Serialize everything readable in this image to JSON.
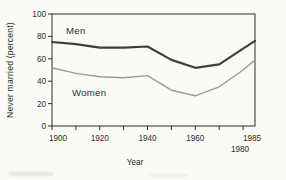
{
  "figure": {
    "background": "#fbfaf7",
    "axis_color": "#2c2c2c",
    "text_color": "#2e2e2e"
  },
  "chart_data": {
    "type": "line",
    "title": "",
    "xlabel": "Year",
    "ylabel": "Never married (percent)",
    "x": [
      1900,
      1910,
      1920,
      1930,
      1940,
      1950,
      1960,
      1970,
      1980,
      1985
    ],
    "series": [
      {
        "name": "Men",
        "color": "#3f3f3f",
        "stroke_width": 2.2,
        "values": [
          75,
          73,
          70,
          70,
          71,
          59,
          52,
          55,
          69,
          76
        ]
      },
      {
        "name": "Women",
        "color": "#9b9b9b",
        "stroke_width": 1.4,
        "values": [
          52,
          47,
          44,
          43,
          45,
          32,
          27,
          35,
          50,
          59
        ]
      }
    ],
    "xlim": [
      1900,
      1985
    ],
    "ylim": [
      0,
      100
    ],
    "x_ticks": [
      1900,
      1910,
      1920,
      1930,
      1940,
      1950,
      1960,
      1970,
      1980
    ],
    "x_tick_labels": [
      {
        "text": "1900",
        "year": 1900,
        "dx": 6,
        "row": 0
      },
      {
        "text": "1920",
        "year": 1920,
        "dx": 0,
        "row": 0
      },
      {
        "text": "1940",
        "year": 1940,
        "dx": 0,
        "row": 0
      },
      {
        "text": "1960",
        "year": 1960,
        "dx": 0,
        "row": 0
      },
      {
        "text": "1985",
        "year": 1985,
        "dx": -3,
        "row": 0
      },
      {
        "text": "1980",
        "year": 1980,
        "dx": -3,
        "row": 1
      }
    ],
    "y_ticks": [
      0,
      20,
      40,
      60,
      80,
      100
    ],
    "grid": false,
    "legend": "inline-labels"
  }
}
